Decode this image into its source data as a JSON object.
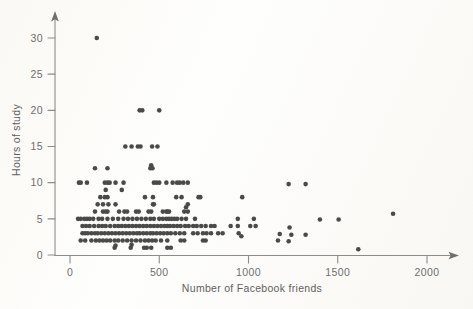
{
  "figure": {
    "name": "scatter-plot-hours-of-study-vs-facebook-friends",
    "background_color": "#fdfdfb",
    "point_color": "#4a4a4a",
    "axis_color": "#8c8c8c",
    "label_color": "#6e6e6e"
  },
  "chart_data": {
    "type": "scatter",
    "title": "",
    "xlabel": "Number of Facebook friends",
    "ylabel": "Hours of study",
    "xlim": [
      -60,
      2100
    ],
    "ylim": [
      -1.2,
      31.8
    ],
    "xticks": [
      0,
      500,
      1000,
      1500,
      2000
    ],
    "xticklabels": [
      "0",
      "500",
      "1000",
      "1500",
      "2000"
    ],
    "yticks": [
      0,
      5,
      10,
      15,
      20,
      25,
      30
    ],
    "yticklabels": [
      "0",
      "5",
      "10",
      "15",
      "20",
      "25",
      "30"
    ],
    "grid": false,
    "legend": false,
    "marker": "circle",
    "marker_size": 2.3,
    "axis_arrows": true,
    "points": [
      [
        150,
        30
      ],
      [
        390,
        20
      ],
      [
        405,
        20
      ],
      [
        500,
        20
      ],
      [
        310,
        15
      ],
      [
        345,
        15
      ],
      [
        380,
        15
      ],
      [
        395,
        15
      ],
      [
        460,
        15
      ],
      [
        490,
        15
      ],
      [
        140,
        12
      ],
      [
        210,
        12
      ],
      [
        450,
        12
      ],
      [
        455,
        12.4
      ],
      [
        462,
        12
      ],
      [
        50,
        10
      ],
      [
        60,
        10
      ],
      [
        95,
        10
      ],
      [
        195,
        10
      ],
      [
        210,
        10
      ],
      [
        222,
        10
      ],
      [
        255,
        10
      ],
      [
        300,
        10
      ],
      [
        470,
        10
      ],
      [
        485,
        10
      ],
      [
        500,
        10
      ],
      [
        540,
        10
      ],
      [
        575,
        10
      ],
      [
        600,
        10
      ],
      [
        615,
        10
      ],
      [
        635,
        10
      ],
      [
        660,
        10
      ],
      [
        1225,
        9.8
      ],
      [
        1320,
        9.8
      ],
      [
        290,
        9
      ],
      [
        200,
        9
      ],
      [
        170,
        8
      ],
      [
        195,
        8
      ],
      [
        210,
        8
      ],
      [
        420,
        8
      ],
      [
        465,
        8
      ],
      [
        595,
        8
      ],
      [
        625,
        8
      ],
      [
        720,
        8
      ],
      [
        730,
        8
      ],
      [
        965,
        8
      ],
      [
        155,
        7
      ],
      [
        185,
        7
      ],
      [
        215,
        7
      ],
      [
        255,
        7
      ],
      [
        465,
        7
      ],
      [
        470,
        7
      ],
      [
        660,
        7
      ],
      [
        650,
        6.6
      ],
      [
        140,
        6
      ],
      [
        185,
        6
      ],
      [
        200,
        6
      ],
      [
        210,
        6
      ],
      [
        275,
        6
      ],
      [
        305,
        6
      ],
      [
        320,
        6
      ],
      [
        370,
        6
      ],
      [
        385,
        6
      ],
      [
        440,
        6
      ],
      [
        455,
        6
      ],
      [
        520,
        6
      ],
      [
        540,
        6
      ],
      [
        545,
        6
      ],
      [
        555,
        6
      ],
      [
        640,
        6
      ],
      [
        660,
        6
      ],
      [
        1810,
        5.7
      ],
      [
        45,
        5
      ],
      [
        60,
        5
      ],
      [
        80,
        5
      ],
      [
        95,
        5
      ],
      [
        110,
        5
      ],
      [
        130,
        5
      ],
      [
        160,
        5
      ],
      [
        180,
        5
      ],
      [
        210,
        5
      ],
      [
        240,
        5
      ],
      [
        270,
        5
      ],
      [
        300,
        5
      ],
      [
        325,
        5
      ],
      [
        350,
        5
      ],
      [
        375,
        5
      ],
      [
        400,
        5
      ],
      [
        425,
        5
      ],
      [
        450,
        5
      ],
      [
        470,
        5
      ],
      [
        500,
        5
      ],
      [
        520,
        5
      ],
      [
        540,
        5
      ],
      [
        555,
        5
      ],
      [
        570,
        5
      ],
      [
        585,
        5
      ],
      [
        600,
        5
      ],
      [
        625,
        5
      ],
      [
        650,
        5
      ],
      [
        700,
        5
      ],
      [
        940,
        5
      ],
      [
        1030,
        5
      ],
      [
        1400,
        4.9
      ],
      [
        1505,
        4.9
      ],
      [
        70,
        4
      ],
      [
        90,
        4
      ],
      [
        110,
        4
      ],
      [
        135,
        4
      ],
      [
        160,
        4
      ],
      [
        180,
        4
      ],
      [
        200,
        4
      ],
      [
        225,
        4
      ],
      [
        250,
        4
      ],
      [
        270,
        4
      ],
      [
        290,
        4
      ],
      [
        310,
        4
      ],
      [
        330,
        4
      ],
      [
        350,
        4
      ],
      [
        370,
        4
      ],
      [
        390,
        4
      ],
      [
        410,
        4
      ],
      [
        430,
        4
      ],
      [
        450,
        4
      ],
      [
        470,
        4
      ],
      [
        490,
        4
      ],
      [
        510,
        4
      ],
      [
        530,
        4
      ],
      [
        545,
        4
      ],
      [
        560,
        4
      ],
      [
        580,
        4
      ],
      [
        600,
        4
      ],
      [
        620,
        4
      ],
      [
        645,
        4
      ],
      [
        665,
        4
      ],
      [
        690,
        4
      ],
      [
        710,
        4
      ],
      [
        735,
        4
      ],
      [
        760,
        4
      ],
      [
        790,
        4
      ],
      [
        810,
        4
      ],
      [
        900,
        4
      ],
      [
        940,
        4
      ],
      [
        1010,
        4
      ],
      [
        1040,
        4
      ],
      [
        1230,
        3.8
      ],
      [
        70,
        3
      ],
      [
        85,
        3
      ],
      [
        100,
        3
      ],
      [
        120,
        3
      ],
      [
        140,
        3
      ],
      [
        155,
        3
      ],
      [
        175,
        3
      ],
      [
        195,
        3
      ],
      [
        215,
        3
      ],
      [
        235,
        3
      ],
      [
        255,
        3
      ],
      [
        275,
        3
      ],
      [
        295,
        3
      ],
      [
        315,
        3
      ],
      [
        335,
        3
      ],
      [
        355,
        3
      ],
      [
        375,
        3
      ],
      [
        390,
        3
      ],
      [
        410,
        3
      ],
      [
        430,
        3
      ],
      [
        450,
        3
      ],
      [
        465,
        3
      ],
      [
        485,
        3
      ],
      [
        505,
        3
      ],
      [
        525,
        3
      ],
      [
        545,
        3
      ],
      [
        565,
        3
      ],
      [
        590,
        3
      ],
      [
        615,
        3
      ],
      [
        640,
        3
      ],
      [
        690,
        3
      ],
      [
        715,
        3
      ],
      [
        745,
        3
      ],
      [
        765,
        3
      ],
      [
        790,
        3
      ],
      [
        830,
        3
      ],
      [
        855,
        3
      ],
      [
        945,
        3
      ],
      [
        1175,
        2.9
      ],
      [
        1240,
        2.8
      ],
      [
        1320,
        2.8
      ],
      [
        960,
        2.6
      ],
      [
        60,
        2
      ],
      [
        85,
        2
      ],
      [
        120,
        2
      ],
      [
        145,
        2
      ],
      [
        165,
        2
      ],
      [
        185,
        2
      ],
      [
        205,
        2
      ],
      [
        225,
        2
      ],
      [
        250,
        2
      ],
      [
        270,
        2
      ],
      [
        295,
        2
      ],
      [
        320,
        2
      ],
      [
        345,
        2
      ],
      [
        370,
        2
      ],
      [
        395,
        2
      ],
      [
        420,
        2
      ],
      [
        440,
        2
      ],
      [
        460,
        2
      ],
      [
        480,
        2
      ],
      [
        510,
        2
      ],
      [
        545,
        2
      ],
      [
        620,
        2
      ],
      [
        640,
        2
      ],
      [
        745,
        2
      ],
      [
        760,
        2
      ],
      [
        1165,
        2
      ],
      [
        1225,
        1.9
      ],
      [
        250,
        1
      ],
      [
        255,
        1.3
      ],
      [
        340,
        1
      ],
      [
        345,
        1.4
      ],
      [
        415,
        1
      ],
      [
        430,
        1
      ],
      [
        455,
        1
      ],
      [
        545,
        1
      ],
      [
        565,
        1
      ],
      [
        1615,
        0.8
      ]
    ]
  }
}
